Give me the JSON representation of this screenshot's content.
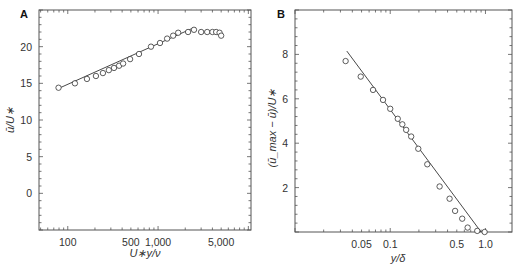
{
  "chart_data": [
    {
      "panel": "A",
      "type": "line",
      "title": "",
      "xlabel": "U∗y/ν",
      "ylabel": "ū/U∗",
      "xscale": "log",
      "xlim": [
        48,
        10700
      ],
      "ylim": [
        -5,
        25
      ],
      "grid": false,
      "xticks": [
        100,
        500,
        1000,
        5000
      ],
      "xtick_labels": [
        "100",
        "500",
        "1,000",
        "5,000"
      ],
      "yticks": [
        0,
        5,
        10,
        15,
        20
      ],
      "ytick_labels": [
        "0",
        "5",
        "10",
        "15",
        "20"
      ],
      "series": [
        {
          "name": "measured",
          "marker": "open-circle",
          "x": [
            79,
            120,
            163,
            205,
            245,
            285,
            325,
            370,
            410,
            490,
            615,
            835,
            1050,
            1260,
            1470,
            1670,
            2150,
            2500,
            3000,
            3500,
            4000,
            4400,
            4800,
            5000
          ],
          "y": [
            14.4,
            15.0,
            15.6,
            16.0,
            16.4,
            16.8,
            17.1,
            17.4,
            17.7,
            18.3,
            19.0,
            20.0,
            20.5,
            21.1,
            21.5,
            21.9,
            22.0,
            22.3,
            22.0,
            22.0,
            22.0,
            22.0,
            21.9,
            21.5
          ]
        },
        {
          "name": "log-law fit",
          "marker": "none",
          "x": [
            79,
            2400
          ],
          "y": [
            14.3,
            22.5
          ]
        }
      ]
    },
    {
      "panel": "B",
      "type": "scatter",
      "title": "",
      "xlabel": "y/δ",
      "ylabel": "(ū_max − ū)/U∗",
      "xscale": "log",
      "xlim": [
        0.01,
        1.9
      ],
      "ylim": [
        0,
        10
      ],
      "grid": false,
      "xticks": [
        0.05,
        0.1,
        0.5,
        1.0
      ],
      "xtick_labels": [
        "0.05",
        "0.1",
        "0.5",
        "1.0"
      ],
      "yticks": [
        2,
        4,
        6,
        8
      ],
      "ytick_labels": [
        "2",
        "4",
        "6",
        "8"
      ],
      "series": [
        {
          "name": "measured",
          "marker": "open-circle",
          "x": [
            0.034,
            0.049,
            0.066,
            0.084,
            0.1,
            0.12,
            0.134,
            0.147,
            0.166,
            0.197,
            0.245,
            0.33,
            0.42,
            0.48,
            0.57,
            0.65,
            0.82,
            0.98
          ],
          "y": [
            7.7,
            7.0,
            6.4,
            5.95,
            5.55,
            5.1,
            4.85,
            4.6,
            4.3,
            3.75,
            3.05,
            2.05,
            1.5,
            0.95,
            0.6,
            0.2,
            0.05,
            0.0
          ]
        },
        {
          "name": "defect-law fit",
          "marker": "none",
          "x": [
            0.035,
            0.9
          ],
          "y": [
            8.15,
            0.0
          ]
        }
      ]
    }
  ],
  "panels": {
    "a": {
      "label": "A",
      "xlabel": "U∗y/ν",
      "ylabel": "ū/U∗"
    },
    "b": {
      "label": "B",
      "xlabel": "y/δ",
      "ylabel": "(ū_max − ū)/U∗"
    }
  }
}
